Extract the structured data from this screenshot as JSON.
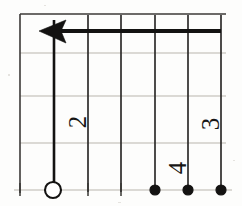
{
  "figure": {
    "orientation": "rotated",
    "background_color": "#fdfdfc",
    "ink_color": "#131211",
    "grid_faint_color": "#b9b5ad",
    "grid_bold_color": "#2e2c2b"
  },
  "grid": {
    "vertical_lines": [
      {
        "name": "v-border-left",
        "x": 20,
        "weight": "bold"
      },
      {
        "name": "v-line-1",
        "x": 54,
        "weight": "bold"
      },
      {
        "name": "v-line-2",
        "x": 88,
        "weight": "bold"
      },
      {
        "name": "v-line-3",
        "x": 121,
        "weight": "bold"
      },
      {
        "name": "v-line-4",
        "x": 155,
        "weight": "bold"
      },
      {
        "name": "v-line-5",
        "x": 188,
        "weight": "bold"
      },
      {
        "name": "v-line-6",
        "x": 221,
        "weight": "bold"
      }
    ],
    "horizontal_lines": [
      {
        "name": "h-border-top",
        "y": 14,
        "weight": "bold"
      },
      {
        "name": "h-line-1",
        "y": 53,
        "weight": "faint"
      },
      {
        "name": "h-line-2",
        "y": 96,
        "weight": "faint"
      },
      {
        "name": "h-line-3",
        "y": 143,
        "weight": "faint"
      },
      {
        "name": "h-axis-bottom",
        "y": 190,
        "weight": "faint"
      }
    ],
    "x_start": 20,
    "x_end": 226,
    "y_start": 14,
    "y_end": 200
  },
  "ray": {
    "name": "bold-leftward-ray",
    "y": 31,
    "x_tail": 221,
    "x_tip": 39,
    "arrow_direction": "left",
    "stroke_width": 4.2,
    "color": "#131211"
  },
  "stem": {
    "name": "vertical-stem",
    "x": 54,
    "y_top": 20,
    "y_bottom": 190,
    "stroke_width": 2.6
  },
  "points": [
    {
      "name": "open-circle-point",
      "type": "open",
      "x": 53,
      "y": 190,
      "radius": 8
    },
    {
      "name": "closed-circle-point-1",
      "type": "closed",
      "x": 155,
      "y": 190,
      "radius": 5
    },
    {
      "name": "closed-circle-point-2",
      "type": "closed",
      "x": 188,
      "y": 190,
      "radius": 5
    },
    {
      "name": "closed-circle-point-3",
      "type": "closed",
      "x": 221,
      "y": 190,
      "radius": 5
    }
  ],
  "ticks": [
    {
      "name": "tick-left-border",
      "x": 20,
      "y": 190
    },
    {
      "name": "tick-mid-1",
      "x": 88,
      "y": 190
    },
    {
      "name": "tick-mid-2",
      "x": 121,
      "y": 190
    }
  ],
  "labels": [
    {
      "name": "digit-label-2",
      "text": "2",
      "x": 86,
      "y": 122,
      "rotation": -90,
      "font_size": 25
    },
    {
      "name": "digit-label-4",
      "text": "4",
      "x": 186,
      "y": 168,
      "rotation": -90,
      "font_size": 23
    },
    {
      "name": "digit-label-3",
      "text": "3",
      "x": 219,
      "y": 124,
      "rotation": -90,
      "font_size": 25
    }
  ],
  "specks": [
    {
      "name": "scan-speck-1",
      "x": 8,
      "y": 74,
      "w": 2,
      "h": 2
    },
    {
      "name": "scan-speck-2",
      "x": 233,
      "y": 160,
      "w": 2,
      "h": 1
    },
    {
      "name": "scan-speck-3",
      "x": 118,
      "y": 202,
      "w": 3,
      "h": 1
    },
    {
      "name": "scan-speck-4",
      "x": 44,
      "y": 5,
      "w": 2,
      "h": 1
    }
  ]
}
